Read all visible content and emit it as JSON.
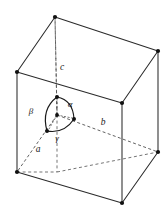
{
  "figure": {
    "background_color": "#ffffff",
    "line_color": "#2b2b2b",
    "hidden_line_color": "#6e6e6e",
    "label_color": "#1a1a1a"
  },
  "axis_labels": {
    "a": "a",
    "b": "b",
    "c": "c"
  },
  "angle_labels": {
    "alpha": "α",
    "beta": "β",
    "gamma": "γ"
  },
  "geometry": {
    "vertices": {
      "back_top": {
        "x": 55,
        "y": 17
      },
      "left_top": {
        "x": 17,
        "y": 72
      },
      "right_top": {
        "x": 158,
        "y": 51
      },
      "front_top": {
        "x": 122,
        "y": 103
      },
      "left_bottom": {
        "x": 17,
        "y": 172
      },
      "right_bottom": {
        "x": 158,
        "y": 152
      },
      "front_bottom": {
        "x": 122,
        "y": 203
      },
      "origin": {
        "x": 57,
        "y": 115
      }
    },
    "solid_edges": [
      [
        "left_top",
        "back_top"
      ],
      [
        "back_top",
        "right_top"
      ],
      [
        "left_top",
        "front_top"
      ],
      [
        "front_top",
        "right_top"
      ],
      [
        "left_top",
        "left_bottom"
      ],
      [
        "right_top",
        "right_bottom"
      ],
      [
        "front_top",
        "front_bottom"
      ],
      [
        "left_bottom",
        "front_bottom"
      ],
      [
        "front_bottom",
        "right_bottom"
      ]
    ],
    "dashed_edges": [
      [
        "back_top",
        "origin"
      ],
      [
        "origin",
        "left_bottom"
      ],
      [
        "origin",
        "right_bottom"
      ]
    ],
    "angle_arc_nodes": {
      "c_node": {
        "x": 57,
        "y": 97
      },
      "b_node": {
        "x": 74,
        "y": 119
      },
      "a_node": {
        "x": 47,
        "y": 131
      }
    }
  },
  "label_positions": {
    "c": {
      "x": 62,
      "y": 70
    },
    "b": {
      "x": 103,
      "y": 125
    },
    "a": {
      "x": 38,
      "y": 152
    },
    "alpha": {
      "x": 70,
      "y": 107
    },
    "beta": {
      "x": 31,
      "y": 114
    },
    "gamma": {
      "x": 57,
      "y": 141
    }
  }
}
